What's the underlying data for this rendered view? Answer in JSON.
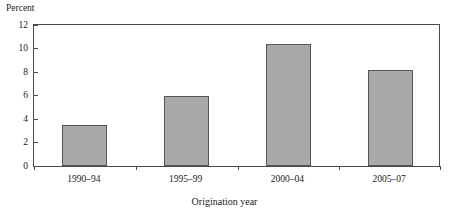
{
  "chart_data": {
    "type": "bar",
    "title": "",
    "categories": [
      "1990–94",
      "1995–99",
      "2000–04",
      "2005–07"
    ],
    "values": [
      3.45,
      6.0,
      10.35,
      8.2
    ],
    "xlabel": "Origination year",
    "ylabel": "Percent",
    "ylim": [
      0,
      12
    ],
    "yticks": [
      0,
      2,
      4,
      6,
      8,
      10,
      12
    ],
    "ytick_labels": [
      "0",
      "2",
      "4",
      "6",
      "8",
      "10",
      "12"
    ],
    "grid": false,
    "legend": null,
    "bar_fill_color": "#a9a9a9",
    "bar_edge_color": "#555555",
    "axis_color": "#4a4a4a",
    "background_color": "#ffffff"
  },
  "axes": {
    "y_title": "Percent",
    "x_title": "Origination year"
  }
}
